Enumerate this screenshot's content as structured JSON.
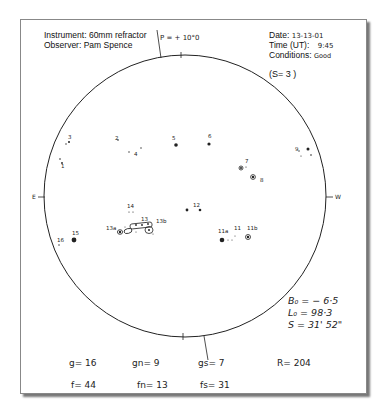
{
  "header": {
    "instrument_label": "Instrument:",
    "instrument_value": "60mm refractor",
    "observer_label": "Observer:",
    "observer_value": "Pam Spence",
    "p_angle": "P = + 10°0",
    "date_label": "Date:",
    "date_value": "13-13-01",
    "time_label": "Time (UT):",
    "time_value": "9:45",
    "conditions_label": "Conditions:",
    "conditions_value": "Good",
    "seeing": "(S= 3 )"
  },
  "disk": {
    "east_label": "E",
    "west_label": "W",
    "spots": [
      {
        "label": "1",
        "x": 62,
        "y": 164
      },
      {
        "label": "2",
        "x": 119,
        "y": 138
      },
      {
        "label": "3",
        "x": 69,
        "y": 138
      },
      {
        "label": "4",
        "x": 137,
        "y": 152
      },
      {
        "label": "5",
        "x": 175,
        "y": 139
      },
      {
        "label": "6",
        "x": 209,
        "y": 137
      },
      {
        "label": "7",
        "x": 246,
        "y": 162
      },
      {
        "label": "8",
        "x": 262,
        "y": 179
      },
      {
        "label": "9",
        "x": 297,
        "y": 150
      },
      {
        "label": "10",
        "x": 310,
        "y": 150
      },
      {
        "label": "11",
        "x": 245,
        "y": 237
      },
      {
        "label": "11a",
        "x": 235,
        "y": 240
      },
      {
        "label": "11b",
        "x": 257,
        "y": 234
      },
      {
        "label": "12",
        "x": 197,
        "y": 208
      },
      {
        "label": "13",
        "x": 150,
        "y": 224
      },
      {
        "label": "13a",
        "x": 111,
        "y": 229
      },
      {
        "label": "13b",
        "x": 160,
        "y": 222
      },
      {
        "label": "14",
        "x": 131,
        "y": 208
      },
      {
        "label": "15",
        "x": 74,
        "y": 237
      },
      {
        "label": "16",
        "x": 59,
        "y": 240
      }
    ]
  },
  "ephemeris": {
    "b0": "B₀ = − 6·5",
    "l0": "L₀ = 98·3",
    "s": "S = 31' 52\""
  },
  "counts": {
    "g": "g= 16",
    "gn": "gn= 9",
    "gs": "gs= 7",
    "r": "R= 204",
    "f": "f= 44",
    "fn": "fn= 13",
    "fs": "fs= 31"
  }
}
